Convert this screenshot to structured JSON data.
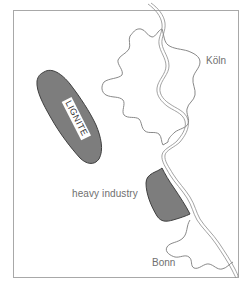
{
  "map": {
    "colors": {
      "frame": "#a8a8a8",
      "river": "#8c8c8c",
      "city_outline": "#7a7a7a",
      "shaded_area": "#7d7d7d",
      "shaded_outline": "#3f3f3f",
      "label_text": "#6f6f6f"
    },
    "labels": {
      "lignite": "LIGNITE",
      "heavy_industry": "heavy industry",
      "koln": "Köln",
      "bonn": "Bonn"
    },
    "features": [
      {
        "name": "Rhine river",
        "type": "river"
      },
      {
        "name": "Köln",
        "type": "city"
      },
      {
        "name": "Bonn",
        "type": "city"
      },
      {
        "name": "LIGNITE",
        "type": "resource-area"
      },
      {
        "name": "heavy industry",
        "type": "industrial-area"
      }
    ]
  }
}
